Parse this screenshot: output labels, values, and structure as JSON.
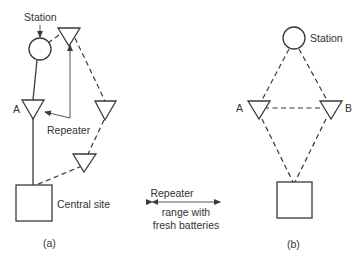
{
  "diagram": {
    "panel_a": {
      "station_label": "Station",
      "node_a_label": "A",
      "repeater_label": "Repeater",
      "central_site_label": "Central site",
      "caption": "(a)"
    },
    "legend": {
      "line1": "Repeater",
      "line2": "range with",
      "line3": "fresh batteries"
    },
    "panel_b": {
      "station_label": "Station",
      "node_a_label": "A",
      "node_b_label": "B",
      "caption": "(b)"
    },
    "colors": {
      "stroke": "#3a3a3a",
      "background": "#ffffff"
    }
  }
}
